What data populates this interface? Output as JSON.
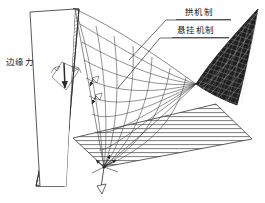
{
  "figure": {
    "type": "architectural-structural-diagram",
    "background_color": "#ffffff",
    "line_color": "#2b2b2b",
    "mesh_dark_color": "#2a2a2a",
    "hatch_color": "#6b6b6b"
  },
  "labels": {
    "edge_force": "边缘力",
    "arch_mechanism": "拱机制",
    "suspension_mechanism": "悬挂机制"
  },
  "annotations": {
    "edge_force_position": "left",
    "arch_mechanism_position": "top-right",
    "suspension_mechanism_position": "top-right-second",
    "leader_lines": 2
  },
  "elements": {
    "left_wall": "hatched-tapered-wall",
    "center_surface": "light-cable-grid",
    "right_surface": "dark-dense-mesh",
    "ground_plane": "horizontal-hatched-plane",
    "force_symbols": 3,
    "convergence_node": "bottom-apex"
  }
}
